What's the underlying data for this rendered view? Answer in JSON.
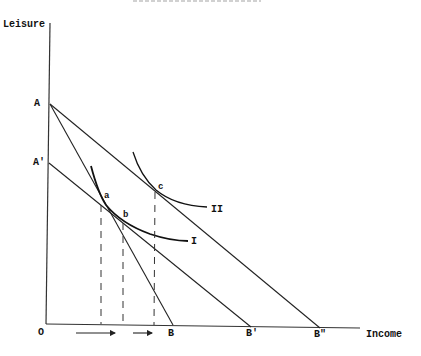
{
  "diagram": {
    "type": "indifference-curve-budget-line",
    "axes": {
      "y_label": "Leisure",
      "x_label": "Income",
      "origin_label": "O"
    },
    "intercepts": {
      "y": [
        {
          "label": "A",
          "x": 50,
          "y": 104
        },
        {
          "label": "A'",
          "x": 49,
          "y": 163
        }
      ],
      "x": [
        {
          "label": "B",
          "x": 173,
          "y": 325
        },
        {
          "label": "B'",
          "x": 251,
          "y": 327
        },
        {
          "label": "B\"",
          "x": 320,
          "y": 328
        }
      ]
    },
    "budget_lines": [
      {
        "name": "A-B",
        "from": "A",
        "to": "B"
      },
      {
        "name": "A'-B'",
        "from": "A'",
        "to": "B'"
      },
      {
        "name": "A-B\"",
        "from": "A",
        "to": "B\""
      }
    ],
    "indifference_curves": [
      {
        "label": "I",
        "through": [
          "a",
          "b"
        ]
      },
      {
        "label": "II",
        "through": [
          "c"
        ]
      }
    ],
    "points": [
      {
        "label": "a",
        "x": 103,
        "y": 202
      },
      {
        "label": "b",
        "x": 123,
        "y": 220
      },
      {
        "label": "c",
        "x": 155,
        "y": 189
      }
    ],
    "dashed_projections_x": [
      101,
      123,
      155
    ],
    "arrows": [
      {
        "from_x": 76,
        "to_x": 116,
        "y": 333
      },
      {
        "from_x": 133,
        "to_x": 153,
        "y": 333
      }
    ]
  },
  "labels": {
    "leisure": "Leisure",
    "income": "Income",
    "origin": "O",
    "A": "A",
    "A_prime": "A'",
    "B": "B",
    "B_prime": "B'",
    "B_double_prime": "B\"",
    "a": "a",
    "b": "b",
    "c": "c",
    "curve_I": "I",
    "curve_II": "II"
  }
}
